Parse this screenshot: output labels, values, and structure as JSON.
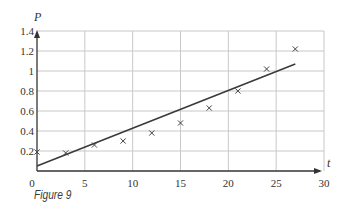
{
  "caption": "Figure 9",
  "chart_data": {
    "type": "scatter",
    "title": "",
    "xlabel": "t",
    "ylabel": "P",
    "xlim": [
      0,
      30
    ],
    "ylim": [
      0,
      1.4
    ],
    "grid": true,
    "x_ticks": [
      "0",
      "5",
      "10",
      "15",
      "20",
      "25",
      "30"
    ],
    "y_ticks": [
      "0.2",
      "0.4",
      "0.6",
      "0.8",
      "1",
      "1.2",
      "1.4"
    ],
    "series": [
      {
        "name": "data",
        "marker": "x",
        "x": [
          0,
          3,
          6,
          9,
          12,
          15,
          18,
          21,
          24,
          27
        ],
        "y": [
          0.19,
          0.18,
          0.26,
          0.3,
          0.38,
          0.48,
          0.63,
          0.8,
          1.02,
          1.22
        ]
      },
      {
        "name": "line of best fit",
        "type": "line",
        "x": [
          0,
          27
        ],
        "y": [
          0.05,
          1.07
        ]
      }
    ],
    "legend": null
  },
  "style": {
    "grid_color": "#c8c8c8",
    "axis_color": "#333333",
    "line_color": "#3a3a3a",
    "marker_color": "#444444"
  }
}
